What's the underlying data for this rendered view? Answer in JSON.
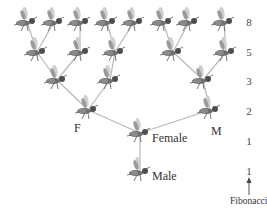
{
  "labels": {
    "F": "F",
    "M": "M",
    "female": "Female",
    "male": "Male",
    "fibonacci": "Fibonacci"
  },
  "fibonacci_column": [
    "8",
    "5",
    "3",
    "2",
    "1",
    "1"
  ],
  "colors": {
    "line": "#b8b8b8",
    "bee_body": "#6e6e6e",
    "bee_wing": "#cfcfcf",
    "text": "#333333"
  },
  "nodes": [
    {
      "id": "male",
      "x": 140,
      "y": 172
    },
    {
      "id": "female",
      "x": 140,
      "y": 133
    },
    {
      "id": "g2f",
      "x": 88,
      "y": 110
    },
    {
      "id": "g2m",
      "x": 210,
      "y": 110
    },
    {
      "id": "g3a",
      "x": 57,
      "y": 80
    },
    {
      "id": "g3b",
      "x": 110,
      "y": 80
    },
    {
      "id": "g3c",
      "x": 203,
      "y": 80
    },
    {
      "id": "g4a",
      "x": 37,
      "y": 52
    },
    {
      "id": "g4b",
      "x": 80,
      "y": 52
    },
    {
      "id": "g4c",
      "x": 115,
      "y": 52
    },
    {
      "id": "g4d",
      "x": 173,
      "y": 52
    },
    {
      "id": "g4e",
      "x": 226,
      "y": 52
    },
    {
      "id": "g5a",
      "x": 27,
      "y": 22
    },
    {
      "id": "g5b",
      "x": 54,
      "y": 22
    },
    {
      "id": "g5c",
      "x": 80,
      "y": 22
    },
    {
      "id": "g5d",
      "x": 107,
      "y": 22
    },
    {
      "id": "g5e",
      "x": 134,
      "y": 22
    },
    {
      "id": "g5f",
      "x": 163,
      "y": 22
    },
    {
      "id": "g5g",
      "x": 189,
      "y": 22
    },
    {
      "id": "g5h",
      "x": 224,
      "y": 22
    }
  ],
  "edges": [
    [
      "male",
      "female"
    ],
    [
      "female",
      "g2f"
    ],
    [
      "female",
      "g2m"
    ],
    [
      "g2f",
      "g3a"
    ],
    [
      "g2f",
      "g3b"
    ],
    [
      "g2m",
      "g3c"
    ],
    [
      "g3a",
      "g4a"
    ],
    [
      "g3a",
      "g4b"
    ],
    [
      "g3b",
      "g4c"
    ],
    [
      "g3c",
      "g4d"
    ],
    [
      "g3c",
      "g4e"
    ],
    [
      "g4a",
      "g5a"
    ],
    [
      "g4a",
      "g5b"
    ],
    [
      "g4b",
      "g5c"
    ],
    [
      "g4c",
      "g5d"
    ],
    [
      "g4c",
      "g5e"
    ],
    [
      "g4d",
      "g5f"
    ],
    [
      "g4d",
      "g5g"
    ],
    [
      "g4e",
      "g5h"
    ]
  ]
}
